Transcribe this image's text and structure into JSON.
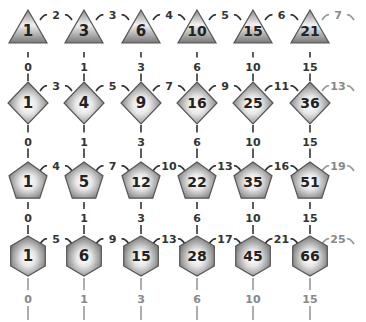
{
  "columns_x": [
    28,
    84,
    141,
    197,
    253,
    310
  ],
  "rows": [
    {
      "name": "triangular",
      "shape": "triangle",
      "y": 30,
      "values": [
        1,
        3,
        6,
        10,
        15,
        21
      ],
      "horizontal_labels": [
        "2",
        "3",
        "4",
        "5",
        "6",
        "7"
      ],
      "down_labels": [
        "0",
        "1",
        "3",
        "6",
        "10",
        "15"
      ]
    },
    {
      "name": "square",
      "shape": "diamond",
      "y": 103,
      "values": [
        1,
        4,
        9,
        16,
        25,
        36
      ],
      "horizontal_labels": [
        "3",
        "5",
        "7",
        "9",
        "11",
        "13"
      ],
      "down_labels": [
        "0",
        "1",
        "3",
        "6",
        "10",
        "15"
      ]
    },
    {
      "name": "pentagonal",
      "shape": "pentagon",
      "y": 180,
      "values": [
        1,
        5,
        12,
        22,
        35,
        51
      ],
      "horizontal_labels": [
        "4",
        "7",
        "10",
        "13",
        "16",
        "19"
      ],
      "down_labels": [
        "0",
        "1",
        "3",
        "6",
        "10",
        "15"
      ]
    },
    {
      "name": "hexagonal",
      "shape": "hexagon",
      "y": 256,
      "values": [
        1,
        6,
        15,
        28,
        45,
        66
      ],
      "horizontal_labels": [
        "5",
        "9",
        "13",
        "17",
        "21",
        "25"
      ],
      "down_labels": [
        "0",
        "1",
        "3",
        "6",
        "10",
        "15"
      ]
    }
  ],
  "colors": {
    "shape_light": "#ffffff",
    "shape_dark": "#6e6e6e",
    "text": "#222222",
    "faded": "#888888"
  }
}
